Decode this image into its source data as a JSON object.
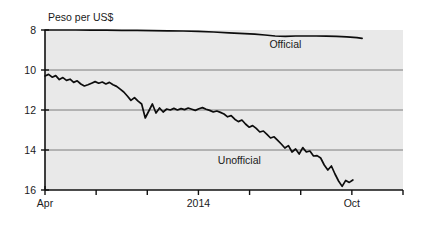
{
  "chart_data": {
    "type": "line",
    "title": "",
    "ylabel": "Peso per US$",
    "xlabel": "",
    "ylim": [
      8,
      16
    ],
    "y_inverted": true,
    "yticks": [
      8,
      10,
      12,
      14,
      16
    ],
    "ytick_labels": [
      "8",
      "10",
      "12",
      "14",
      "16"
    ],
    "gridlines": [
      10,
      12,
      14
    ],
    "grid": true,
    "legend_position": "inline-annotations",
    "xlim": [
      0,
      7
    ],
    "xticks": [
      0,
      1,
      2,
      3,
      4,
      5,
      6,
      7
    ],
    "xtick_labels": [
      "Apr",
      "",
      "",
      "2014",
      "",
      "",
      "Oct",
      ""
    ],
    "xtick_labels_shown": [
      "Apr",
      "2014",
      "Oct"
    ],
    "annotations": [
      {
        "text": "Official",
        "x": 4.7,
        "y": 8.9
      },
      {
        "text": "Unofficial",
        "x": 3.8,
        "y": 14.7
      }
    ],
    "series": [
      {
        "name": "Official",
        "color": "#0d0d0d",
        "x": [
          0.0,
          0.3,
          0.6,
          0.9,
          1.2,
          1.5,
          1.8,
          2.1,
          2.4,
          2.7,
          3.0,
          3.3,
          3.6,
          3.9,
          4.1,
          4.3,
          4.5,
          4.7,
          4.9,
          5.1,
          5.3,
          5.5,
          5.7,
          5.9,
          6.1,
          6.2
        ],
        "values": [
          8.0,
          8.0,
          8.0,
          8.01,
          8.01,
          8.02,
          8.02,
          8.03,
          8.04,
          8.05,
          8.07,
          8.1,
          8.14,
          8.18,
          8.21,
          8.25,
          8.3,
          8.32,
          8.3,
          8.3,
          8.3,
          8.31,
          8.32,
          8.34,
          8.38,
          8.42
        ]
      },
      {
        "name": "Unofficial",
        "color": "#0d0d0d",
        "x": [
          0.0,
          0.07,
          0.14,
          0.21,
          0.28,
          0.35,
          0.42,
          0.49,
          0.56,
          0.63,
          0.7,
          0.77,
          0.84,
          0.91,
          0.98,
          1.05,
          1.12,
          1.19,
          1.26,
          1.33,
          1.4,
          1.47,
          1.54,
          1.61,
          1.68,
          1.75,
          1.82,
          1.89,
          1.96,
          2.03,
          2.1,
          2.17,
          2.24,
          2.31,
          2.38,
          2.45,
          2.52,
          2.59,
          2.66,
          2.73,
          2.8,
          2.87,
          2.94,
          3.01,
          3.08,
          3.15,
          3.22,
          3.29,
          3.36,
          3.43,
          3.5,
          3.57,
          3.64,
          3.71,
          3.78,
          3.85,
          3.92,
          3.99,
          4.06,
          4.13,
          4.2,
          4.27,
          4.34,
          4.41,
          4.48,
          4.55,
          4.62,
          4.69,
          4.76,
          4.83,
          4.9,
          4.97,
          5.04,
          5.11,
          5.18,
          5.25,
          5.32,
          5.39,
          5.46,
          5.53,
          5.6,
          5.67,
          5.74,
          5.81,
          5.88,
          5.95,
          6.02
        ],
        "values": [
          10.3,
          10.22,
          10.36,
          10.28,
          10.48,
          10.38,
          10.52,
          10.46,
          10.62,
          10.54,
          10.7,
          10.8,
          10.74,
          10.66,
          10.58,
          10.66,
          10.6,
          10.7,
          10.62,
          10.74,
          10.82,
          10.96,
          11.1,
          11.3,
          11.52,
          11.38,
          11.56,
          11.7,
          12.4,
          12.05,
          11.7,
          12.15,
          11.9,
          12.1,
          11.95,
          12.0,
          11.92,
          12.0,
          11.93,
          11.98,
          11.9,
          11.96,
          12.02,
          11.94,
          11.88,
          11.96,
          12.02,
          12.1,
          12.05,
          12.12,
          12.2,
          12.34,
          12.28,
          12.46,
          12.58,
          12.5,
          12.7,
          12.86,
          12.78,
          12.92,
          13.1,
          13.05,
          13.22,
          13.4,
          13.34,
          13.52,
          13.7,
          13.9,
          13.78,
          14.1,
          13.95,
          14.2,
          13.88,
          14.1,
          14.05,
          14.3,
          14.28,
          14.4,
          14.75,
          15.0,
          14.8,
          15.2,
          15.55,
          15.82,
          15.52,
          15.62,
          15.5
        ]
      }
    ]
  },
  "axes": {
    "ylabel_text": "Peso per US$"
  }
}
